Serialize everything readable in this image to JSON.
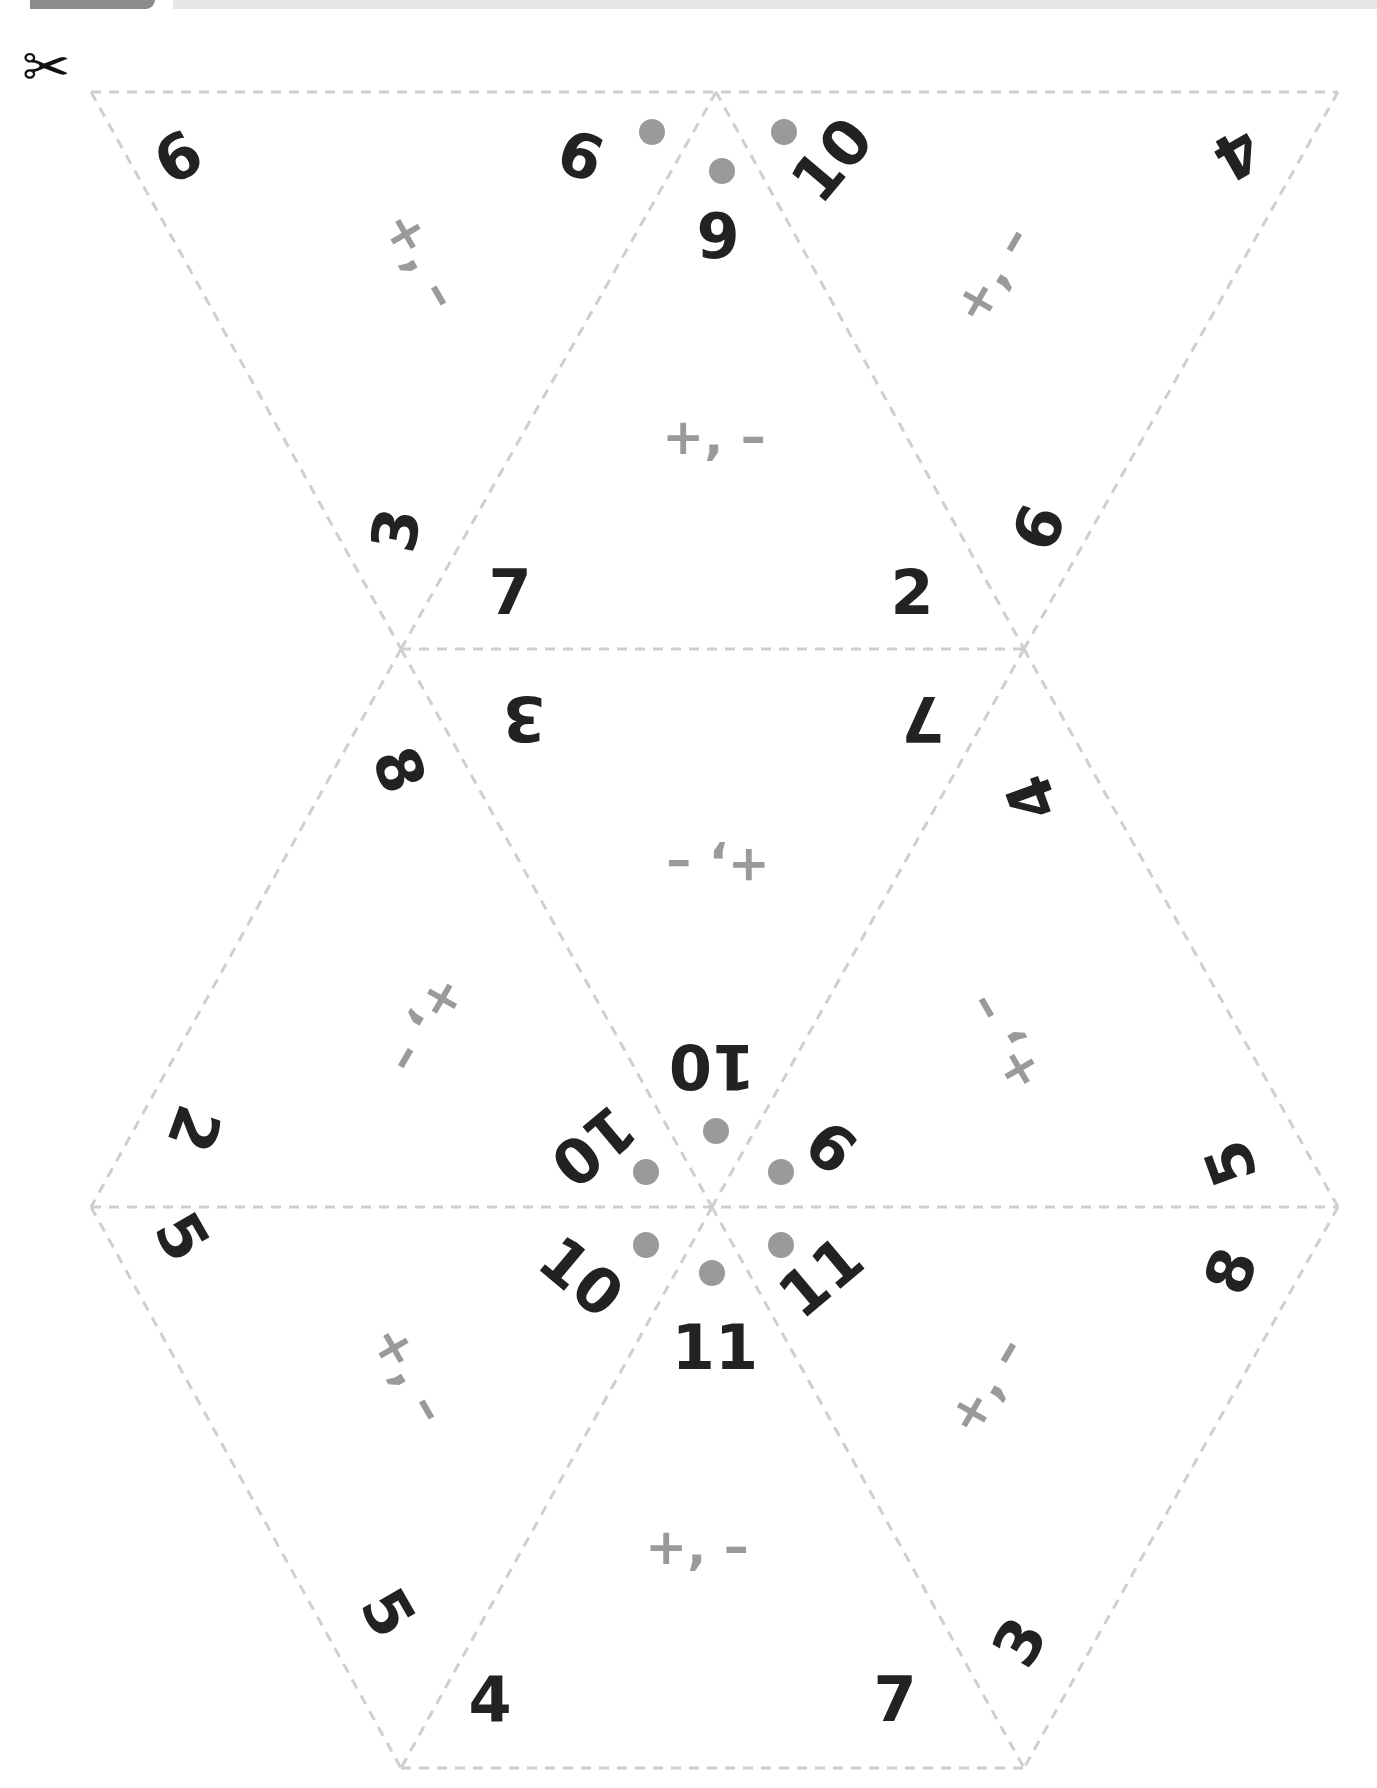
{
  "header": {
    "tab_color": "#8c8c8c",
    "bar_color": "#e6e6e6"
  },
  "colors": {
    "number": "#222222",
    "operation": "#9a9a9a",
    "cut_line": "#cfcfcf",
    "dot": "#9a9a9a"
  },
  "scissors_icon": "✂",
  "operation_label": "+, –",
  "labels": [
    {
      "id": "l1",
      "text": "9",
      "x": 177,
      "y": 156,
      "rot": 150
    },
    {
      "id": "l2",
      "text": "9",
      "x": 581,
      "y": 154,
      "rot": 200
    },
    {
      "id": "l3",
      "text": "9",
      "x": 718,
      "y": 236,
      "rot": 0
    },
    {
      "id": "l4",
      "text": "10",
      "x": 832,
      "y": 160,
      "rot": -50
    },
    {
      "id": "l5",
      "text": "4",
      "x": 1237,
      "y": 154,
      "rot": 150
    },
    {
      "id": "l6",
      "text": "3",
      "x": 396,
      "y": 530,
      "rot": -80
    },
    {
      "id": "l7",
      "text": "7",
      "x": 510,
      "y": 592,
      "rot": 0
    },
    {
      "id": "l8",
      "text": "2",
      "x": 912,
      "y": 592,
      "rot": 0
    },
    {
      "id": "l9",
      "text": "9",
      "x": 1037,
      "y": 527,
      "rot": 110
    },
    {
      "id": "l10",
      "text": "3",
      "x": 524,
      "y": 718,
      "rot": 180
    },
    {
      "id": "l11",
      "text": "7",
      "x": 923,
      "y": 718,
      "rot": 180
    },
    {
      "id": "l12",
      "text": "8",
      "x": 399,
      "y": 770,
      "rot": 70
    },
    {
      "id": "l13",
      "text": "4",
      "x": 1032,
      "y": 798,
      "rot": -110
    },
    {
      "id": "l14",
      "text": "10",
      "x": 712,
      "y": 1066,
      "rot": 180
    },
    {
      "id": "l15",
      "text": "2",
      "x": 194,
      "y": 1129,
      "rot": 110
    },
    {
      "id": "l16",
      "text": "10",
      "x": 593,
      "y": 1146,
      "rot": 140
    },
    {
      "id": "l17",
      "text": "9",
      "x": 832,
      "y": 1146,
      "rot": -140
    },
    {
      "id": "l18",
      "text": "5",
      "x": 1231,
      "y": 1163,
      "rot": -110
    },
    {
      "id": "l19",
      "text": "5",
      "x": 182,
      "y": 1237,
      "rot": 60
    },
    {
      "id": "l20",
      "text": "10",
      "x": 581,
      "y": 1277,
      "rot": 40
    },
    {
      "id": "l21",
      "text": "11",
      "x": 821,
      "y": 1277,
      "rot": -40
    },
    {
      "id": "l22",
      "text": "11",
      "x": 715,
      "y": 1347,
      "rot": 0
    },
    {
      "id": "l23",
      "text": "8",
      "x": 1231,
      "y": 1271,
      "rot": -70
    },
    {
      "id": "l24",
      "text": "5",
      "x": 388,
      "y": 1613,
      "rot": 60
    },
    {
      "id": "l25",
      "text": "4",
      "x": 490,
      "y": 1699,
      "rot": 0
    },
    {
      "id": "l26",
      "text": "7",
      "x": 895,
      "y": 1699,
      "rot": 0
    },
    {
      "id": "l27",
      "text": "3",
      "x": 1020,
      "y": 1642,
      "rot": -60
    }
  ],
  "operations": [
    {
      "x": 422,
      "y": 260,
      "rot": 60
    },
    {
      "x": 714,
      "y": 437,
      "rot": 0
    },
    {
      "x": 992,
      "y": 274,
      "rot": -60
    },
    {
      "x": 718,
      "y": 866,
      "rot": 180
    },
    {
      "x": 428,
      "y": 1026,
      "rot": 120
    },
    {
      "x": 1003,
      "y": 1043,
      "rot": -120
    },
    {
      "x": 410,
      "y": 1374,
      "rot": 60
    },
    {
      "x": 986,
      "y": 1385,
      "rot": -60
    },
    {
      "x": 697,
      "y": 1547,
      "rot": 0
    }
  ],
  "dots": [
    {
      "x": 652,
      "y": 132
    },
    {
      "x": 722,
      "y": 171
    },
    {
      "x": 784,
      "y": 132
    },
    {
      "x": 716,
      "y": 1131
    },
    {
      "x": 646,
      "y": 1172
    },
    {
      "x": 781,
      "y": 1172
    },
    {
      "x": 646,
      "y": 1245
    },
    {
      "x": 712,
      "y": 1273
    },
    {
      "x": 781,
      "y": 1245
    }
  ]
}
